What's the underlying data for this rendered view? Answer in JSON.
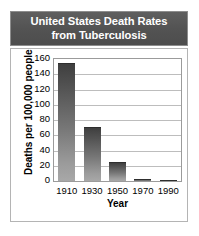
{
  "chart_data": {
    "type": "bar",
    "title": "United States Death Rates from Tuberculosis",
    "title_lines": [
      "United States Death Rates",
      "from Tuberculosis"
    ],
    "categories": [
      "1910",
      "1930",
      "1950",
      "1970",
      "1990"
    ],
    "values": [
      155,
      71,
      25,
      3,
      1
    ],
    "xlabel": "Year",
    "ylabel": "Deaths per 100,000 people",
    "ylim": [
      0,
      160
    ],
    "yticks": [
      160,
      140,
      120,
      100,
      80,
      60,
      40,
      20,
      0
    ],
    "grid": true,
    "legend": "none",
    "series_color": "#555555"
  },
  "colors": {
    "banner_bg": "#535353",
    "banner_text": "#ffffff",
    "frame_border": "#b4b4b4",
    "plot_border": "#9b9b9b",
    "gridline": "#bdbdbd",
    "bar_top": "#3f3f3f",
    "bar_bottom": "#a8a8a8",
    "page_bg": "#ffffff",
    "axis_text": "#000000"
  }
}
